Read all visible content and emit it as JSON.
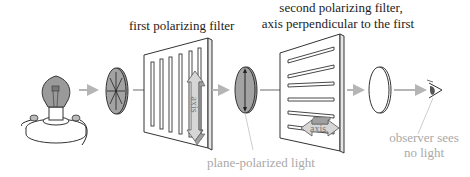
{
  "diagram": {
    "type": "polarization-illustration",
    "labels": {
      "first_filter": "first polarizing filter",
      "second_filter_line1": "second polarizing filter,",
      "second_filter_line2": "axis perpendicular to the first",
      "plane_polarized": "plane-polarized light",
      "observer_line1": "observer sees",
      "observer_line2": "no light",
      "axis_first": "axis",
      "axis_second": "axis"
    },
    "components": [
      {
        "id": "light-source",
        "name": "light bulb"
      },
      {
        "id": "unpolarized-light",
        "name": "unpolarized light disc"
      },
      {
        "id": "first-filter",
        "name": "first polarizing filter",
        "axis": "vertical"
      },
      {
        "id": "polarized-light",
        "name": "plane-polarized light disc"
      },
      {
        "id": "second-filter",
        "name": "second polarizing filter",
        "axis": "horizontal"
      },
      {
        "id": "no-light",
        "name": "empty disc"
      },
      {
        "id": "observer",
        "name": "eye"
      }
    ],
    "colors": {
      "arrow": "#b5b5b5",
      "disc_fill": "#9a9a9a",
      "axis_arrow": "#d6d6d6",
      "line": "#333333",
      "gray_text": "#a9a9a9"
    }
  }
}
